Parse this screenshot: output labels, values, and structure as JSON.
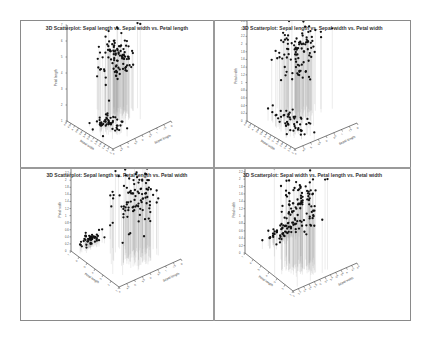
{
  "figure": {
    "panels": [
      {
        "title": "3D Scatterplot: Sepal length vs. Sepal width vs. Petal length",
        "xlabel": "Sepal length",
        "ylabel": "Sepal width",
        "zlabel": "Petal length"
      },
      {
        "title": "3D Scatterplot: Sepal length vs. Sepal width vs. Petal width",
        "xlabel": "Sepal length",
        "ylabel": "Sepal width",
        "zlabel": "Petal width"
      },
      {
        "title": "3D Scatterplot: Sepal length vs. Petal length vs. Petal width",
        "xlabel": "Sepal length",
        "ylabel": "Petal length",
        "zlabel": "Petal width"
      },
      {
        "title": "3D Scatterplot: Sepal width vs. Petal length vs. Petal width",
        "xlabel": "Sepal width",
        "ylabel": "Petal length",
        "zlabel": "Petal width"
      }
    ]
  },
  "chart_data": [
    {
      "type": "scatter",
      "title": "3D Scatterplot: Sepal length vs. Sepal width vs. Petal length",
      "xlabel": "Sepal length",
      "ylabel": "Sepal width",
      "zlabel": "Petal length",
      "xlim": [
        4,
        8
      ],
      "ylim": [
        2,
        4.5
      ],
      "zlim": [
        1,
        7
      ],
      "x_ticks": [
        "4",
        "4.5",
        "5",
        "5.5",
        "6",
        "6.5",
        "7",
        "7.5",
        "8"
      ],
      "y_ticks": [
        "2",
        "2.2",
        "2.4",
        "2.6",
        "2.8",
        "3",
        "3.2",
        "3.4",
        "3.6",
        "3.8",
        "4",
        "4.2",
        "4.4"
      ],
      "z_ticks": [
        "1",
        "2",
        "3",
        "4",
        "5",
        "6",
        "7"
      ],
      "drop_lines": true,
      "clusters": [
        {
          "name": "setosa-like cluster",
          "n": 50,
          "x_center": 5.0,
          "y_center": 3.4,
          "z_center": 1.5
        },
        {
          "name": "versicolor/virginica cluster",
          "n": 100,
          "x_center": 6.3,
          "y_center": 2.9,
          "z_center": 4.9
        }
      ]
    },
    {
      "type": "scatter",
      "title": "3D Scatterplot: Sepal length vs. Sepal width vs. Petal width",
      "xlabel": "Sepal length",
      "ylabel": "Sepal width",
      "zlabel": "Petal width",
      "xlim": [
        4,
        8
      ],
      "ylim": [
        2,
        4.5
      ],
      "zlim": [
        0,
        2.6
      ],
      "x_ticks": [
        "4",
        "4.5",
        "5",
        "5.5",
        "6",
        "6.5",
        "7",
        "7.5",
        "8"
      ],
      "y_ticks": [
        "2",
        "2.2",
        "2.4",
        "2.6",
        "2.8",
        "3",
        "3.2",
        "3.4",
        "3.6",
        "3.8",
        "4",
        "4.2",
        "4.4"
      ],
      "z_ticks": [
        "0",
        "0.2",
        "0.4",
        "0.6",
        "0.8",
        "1",
        "1.2",
        "1.4",
        "1.6",
        "1.8",
        "2",
        "2.2",
        "2.4",
        "2.6"
      ],
      "drop_lines": true,
      "clusters": [
        {
          "name": "setosa-like cluster",
          "n": 50,
          "x_center": 5.0,
          "y_center": 3.4,
          "z_center": 0.25
        },
        {
          "name": "versicolor/virginica cluster",
          "n": 100,
          "x_center": 6.3,
          "y_center": 2.9,
          "z_center": 1.7
        }
      ]
    },
    {
      "type": "scatter",
      "title": "3D Scatterplot: Sepal length vs. Petal length vs. Petal width",
      "xlabel": "Sepal length",
      "ylabel": "Petal length",
      "zlabel": "Petal width",
      "xlim": [
        4,
        8
      ],
      "ylim": [
        1,
        7
      ],
      "zlim": [
        0,
        2.6
      ],
      "x_ticks": [
        "4",
        "4.5",
        "5",
        "5.5",
        "6",
        "6.5",
        "7",
        "7.5",
        "8"
      ],
      "y_ticks": [
        "1",
        "2",
        "3",
        "4",
        "5",
        "6",
        "7"
      ],
      "z_ticks": [
        "0",
        "0.2",
        "0.4",
        "0.6",
        "0.8",
        "1",
        "1.2",
        "1.4",
        "1.6",
        "1.8",
        "2",
        "2.2",
        "2.4",
        "2.6"
      ],
      "drop_lines": true,
      "clusters": [
        {
          "name": "setosa-like cluster",
          "n": 50,
          "x_center": 5.0,
          "y_center": 1.5,
          "z_center": 0.25
        },
        {
          "name": "versicolor/virginica cluster",
          "n": 100,
          "x_center": 6.3,
          "y_center": 4.9,
          "z_center": 1.7
        }
      ]
    },
    {
      "type": "scatter",
      "title": "3D Scatterplot: Sepal width vs. Petal length vs. Petal width",
      "xlabel": "Sepal width",
      "ylabel": "Petal length",
      "zlabel": "Petal width",
      "xlim": [
        2,
        4.5
      ],
      "ylim": [
        1,
        7
      ],
      "zlim": [
        0,
        2.6
      ],
      "x_ticks": [
        "2",
        "2.2",
        "2.4",
        "2.6",
        "2.8",
        "3",
        "3.2",
        "3.4",
        "3.6",
        "3.8",
        "4",
        "4.2",
        "4.4"
      ],
      "y_ticks": [
        "1",
        "2",
        "3",
        "4",
        "5",
        "6",
        "7"
      ],
      "z_ticks": [
        "0",
        "0.2",
        "0.4",
        "0.6",
        "0.8",
        "1",
        "1.2",
        "1.4",
        "1.6",
        "1.8",
        "2",
        "2.2",
        "2.4",
        "2.6"
      ],
      "drop_lines": true,
      "clusters": [
        {
          "name": "setosa-like cluster",
          "n": 50,
          "x_center": 3.4,
          "y_center": 1.5,
          "z_center": 0.25
        },
        {
          "name": "versicolor/virginica cluster",
          "n": 100,
          "x_center": 2.9,
          "y_center": 4.9,
          "z_center": 1.7
        }
      ]
    }
  ],
  "colors": {
    "point": "#111111",
    "drop_line": "#9a9a9a",
    "axis": "#444444",
    "border": "#8a8a8a",
    "title": "#333333"
  }
}
